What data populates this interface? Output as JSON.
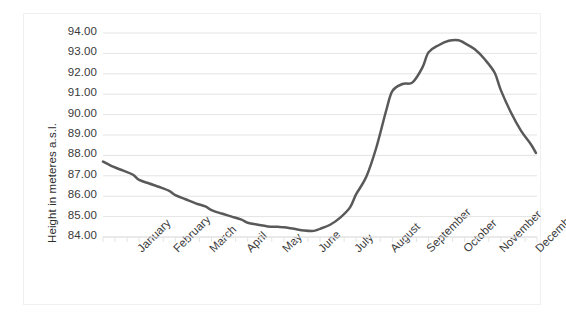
{
  "chart_data": {
    "type": "line",
    "title": "",
    "xlabel": "",
    "ylabel": "Height in meteres a.s.l.",
    "ylim": [
      84.0,
      94.0
    ],
    "ytick_step": 1.0,
    "ytick_labels": [
      "94.00",
      "93.00",
      "92.00",
      "91.00",
      "90.00",
      "89.00",
      "88.00",
      "87.00",
      "86.00",
      "85.00",
      "84.00"
    ],
    "ytick_values": [
      94.0,
      93.0,
      92.0,
      91.0,
      90.0,
      89.0,
      88.0,
      87.0,
      86.0,
      85.0,
      84.0
    ],
    "categories": [
      "January",
      "February",
      "March",
      "April",
      "May",
      "June",
      "July",
      "August",
      "September",
      "October",
      "November",
      "December"
    ],
    "grid": true,
    "grid_axis": "y",
    "legend": false,
    "legend_position": "none",
    "minor_ticks_per_category": 3,
    "line_color": "#595959",
    "line_width": 2.5,
    "markers": false,
    "series": [
      {
        "name": "Height in meteres a.s.l.",
        "x": [
          0.0,
          0.28,
          0.56,
          0.83,
          1.0,
          1.28,
          1.56,
          1.83,
          2.0,
          2.28,
          2.56,
          2.83,
          3.0,
          3.28,
          3.56,
          3.83,
          4.0,
          4.28,
          4.56,
          4.83,
          5.0,
          5.28,
          5.56,
          5.83,
          6.0,
          6.28,
          6.56,
          6.83,
          7.0,
          7.28,
          7.56,
          7.83,
          8.0,
          8.28,
          8.56,
          8.83,
          9.0,
          9.28,
          9.56,
          9.83,
          10.0,
          10.28,
          10.56,
          10.83,
          11.0,
          11.28,
          11.56,
          11.83
        ],
        "values": [
          87.7,
          87.45,
          87.25,
          87.05,
          86.8,
          86.62,
          86.45,
          86.26,
          86.05,
          85.85,
          85.65,
          85.5,
          85.32,
          85.15,
          85.0,
          84.85,
          84.7,
          84.6,
          84.52,
          84.5,
          84.48,
          84.4,
          84.32,
          84.3,
          84.4,
          84.6,
          84.95,
          85.45,
          86.1,
          86.95,
          88.4,
          90.2,
          91.15,
          91.5,
          91.58,
          92.3,
          93.05,
          93.4,
          93.62,
          93.65,
          93.5,
          93.2,
          92.7,
          92.05,
          91.2,
          90.1,
          89.2,
          88.55
        ]
      }
    ],
    "annotations": [
      {
        "label": "start",
        "x": 0.0,
        "y": 87.7
      },
      {
        "label": "minimum",
        "x": 5.83,
        "y": 84.3
      },
      {
        "label": "shelf",
        "x": 8.28,
        "y": 91.5
      },
      {
        "label": "peak",
        "x": 9.83,
        "y": 93.65
      },
      {
        "label": "end",
        "x": 11.97,
        "y": 88.12
      }
    ],
    "end_value": 88.12
  },
  "colors": {
    "line": "#595959",
    "gridline": "#e4e4e4",
    "axis_line": "#d4d4d4",
    "text": "#3a3a3a",
    "frame": "#f0f0f0",
    "background": "#ffffff"
  }
}
